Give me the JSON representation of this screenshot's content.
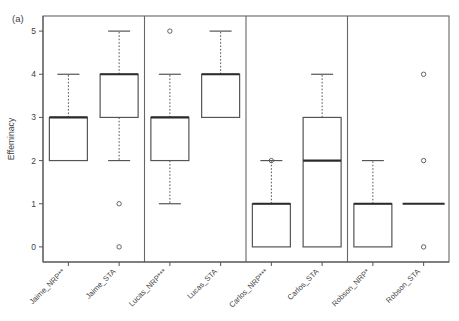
{
  "figure": {
    "panel_tag": "(a)",
    "background": "#ffffff",
    "line_color": "#555555",
    "median_color": "#2b2b2b"
  },
  "chart_data": {
    "type": "box",
    "title": "",
    "subtitle": "",
    "panel_label": "(a)",
    "xlabel": "",
    "ylabel": "Effeminacy",
    "ylim": [
      -0.35,
      5.35
    ],
    "yticks": [
      0,
      1,
      2,
      3,
      4,
      5
    ],
    "ytick_labels": [
      "0",
      "1",
      "2",
      "3",
      "4",
      "5"
    ],
    "grid": false,
    "legend": "none",
    "group_separators": [
      2,
      4,
      6
    ],
    "categories": [
      "Jaime_NRP**",
      "Jaime_STA",
      "Lucas_NRP***",
      "Lucas_STA",
      "Carlos_NRP***",
      "Carlos_STA",
      "Robson_NRP*",
      "Robson_STA"
    ],
    "boxes": [
      {
        "label": "Jaime_NRP**",
        "lower_whisker": 2,
        "q1": 2,
        "median": 3,
        "q3": 3,
        "upper_whisker": 4,
        "outliers": []
      },
      {
        "label": "Jaime_STA",
        "lower_whisker": 2,
        "q1": 3,
        "median": 4,
        "q3": 4,
        "upper_whisker": 5,
        "outliers": [
          1,
          0
        ]
      },
      {
        "label": "Lucas_NRP***",
        "lower_whisker": 1,
        "q1": 2,
        "median": 3,
        "q3": 3,
        "upper_whisker": 4,
        "outliers": [
          5
        ]
      },
      {
        "label": "Lucas_STA",
        "lower_whisker": 3,
        "q1": 3,
        "median": 4,
        "q3": 4,
        "upper_whisker": 5,
        "outliers": []
      },
      {
        "label": "Carlos_NRP***",
        "lower_whisker": 0,
        "q1": 0,
        "median": 1,
        "q3": 1,
        "upper_whisker": 2,
        "outliers": [
          2
        ]
      },
      {
        "label": "Carlos_STA",
        "lower_whisker": 0,
        "q1": 0,
        "median": 2,
        "q3": 3,
        "upper_whisker": 4,
        "outliers": []
      },
      {
        "label": "Robson_NRP*",
        "lower_whisker": 0,
        "q1": 0,
        "median": 1,
        "q3": 1,
        "upper_whisker": 2,
        "outliers": []
      },
      {
        "label": "Robson_STA",
        "lower_whisker": 1,
        "q1": 1,
        "median": 1,
        "q3": 1,
        "upper_whisker": 1,
        "outliers": [
          4,
          2,
          0
        ]
      }
    ]
  }
}
